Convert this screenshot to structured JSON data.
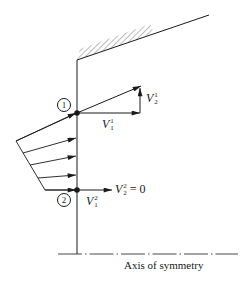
{
  "diagram": {
    "points": [
      {
        "id": "1",
        "label": "1"
      },
      {
        "id": "2",
        "label": "2"
      }
    ],
    "vectors": {
      "v1_1": {
        "symbol": "V",
        "sup": "1",
        "sub": "1"
      },
      "v1_2": {
        "symbol": "V",
        "sup": "1",
        "sub": "2"
      },
      "v2_1": {
        "symbol": "V",
        "sup": "2",
        "sub": "1"
      },
      "v2_2": {
        "symbol": "V",
        "sup": "2",
        "sub": "2",
        "suffix": " = 0"
      }
    },
    "axis_label": "Axis of symmetry",
    "colors": {
      "ink": "#1a1a1a",
      "background": "#ffffff"
    }
  }
}
